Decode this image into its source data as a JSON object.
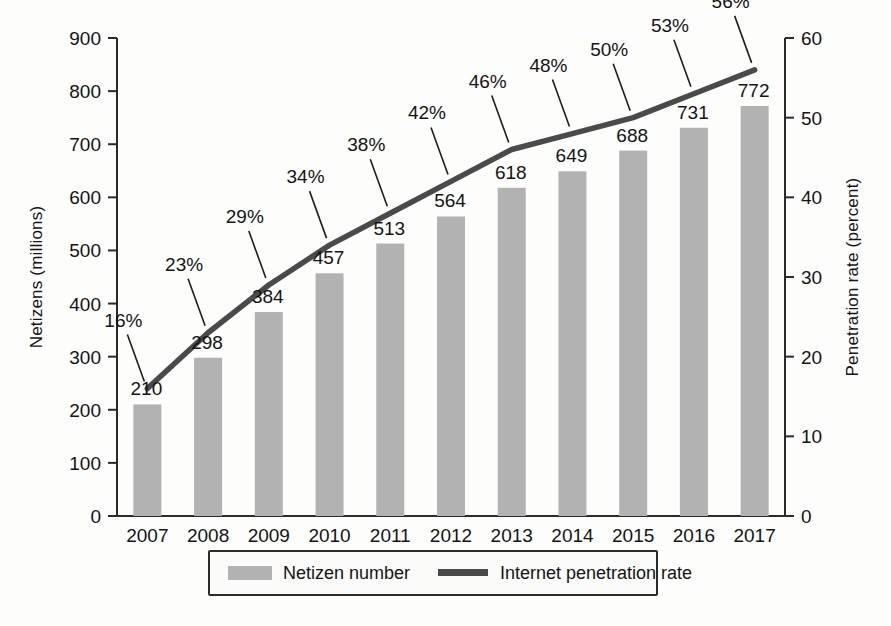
{
  "chart_data": {
    "type": "bar",
    "title": "",
    "subtitle": "",
    "xlabel": "",
    "ylabel": "Netizens (millions)",
    "y2label": "Penetration rate (percent)",
    "categories": [
      "2007",
      "2008",
      "2009",
      "2010",
      "2011",
      "2012",
      "2013",
      "2014",
      "2015",
      "2016",
      "2017"
    ],
    "ylim": [
      0,
      900
    ],
    "y2lim": [
      0,
      60
    ],
    "yticks": [
      0,
      100,
      200,
      300,
      400,
      500,
      600,
      700,
      800,
      900
    ],
    "y2ticks": [
      0,
      10,
      20,
      30,
      40,
      50,
      60
    ],
    "grid": false,
    "legend_position": "bottom",
    "series": [
      {
        "name": "Netizen number",
        "type": "bar",
        "axis": "left",
        "unit": "millions",
        "color": "#b2b2b2",
        "values": [
          210,
          298,
          384,
          457,
          513,
          564,
          618,
          649,
          688,
          731,
          772
        ],
        "labels": [
          "210",
          "298",
          "384",
          "457",
          "513",
          "564",
          "618",
          "649",
          "688",
          "731",
          "772"
        ]
      },
      {
        "name": "Internet penetration rate",
        "type": "line",
        "axis": "right",
        "unit": "percent",
        "color": "#4a4a4a",
        "values": [
          16,
          23,
          29,
          34,
          38,
          42,
          46,
          48,
          50,
          53,
          56
        ],
        "labels": [
          "16%",
          "23%",
          "29%",
          "34%",
          "38%",
          "42%",
          "46%",
          "48%",
          "50%",
          "53%",
          "56%"
        ]
      }
    ]
  },
  "axes": {
    "left": {
      "title": "Netizens (millions)",
      "ticks": [
        "0",
        "100",
        "200",
        "300",
        "400",
        "500",
        "600",
        "700",
        "800",
        "900"
      ]
    },
    "right": {
      "title": "Penetration rate (percent)",
      "ticks": [
        "0",
        "10",
        "20",
        "30",
        "40",
        "50",
        "60"
      ]
    },
    "bottom": {
      "ticks": [
        "2007",
        "2008",
        "2009",
        "2010",
        "2011",
        "2012",
        "2013",
        "2014",
        "2015",
        "2016",
        "2017"
      ]
    }
  },
  "legend": {
    "items": [
      {
        "label": "Netizen number",
        "marker": "bar-swatch",
        "color": "#b2b2b2"
      },
      {
        "label": "Internet penetration rate",
        "marker": "line-swatch",
        "color": "#4a4a4a"
      }
    ]
  },
  "colors": {
    "bar": "#b2b2b2",
    "line": "#4a4a4a",
    "axis": "#2b2b2b",
    "text": "#141414",
    "background": "#fdfdfc"
  }
}
